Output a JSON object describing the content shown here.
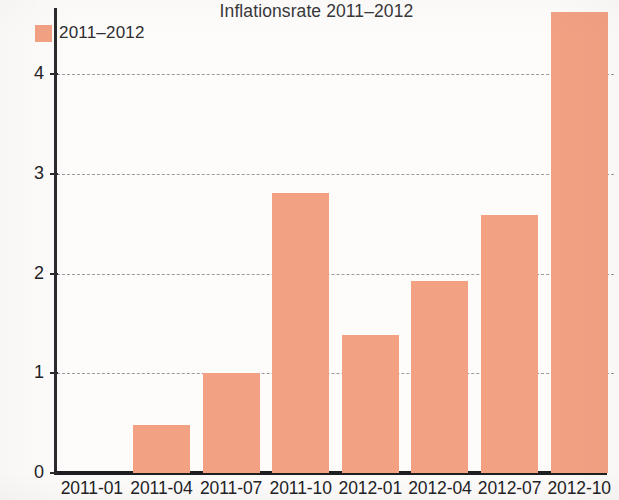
{
  "chart_data": {
    "type": "bar",
    "title": "Inflationsrate 2011–2012",
    "xlabel": "",
    "ylabel": "",
    "categories": [
      "2011-01",
      "2011-04",
      "2011-07",
      "2011-10",
      "2012-01",
      "2012-04",
      "2012-07",
      "2012-10"
    ],
    "values": [
      0,
      0.48,
      1.0,
      2.81,
      1.38,
      1.93,
      2.59,
      4.62
    ],
    "series": [
      {
        "name": "2011–2012",
        "values": [
          0,
          0.48,
          1.0,
          2.81,
          1.38,
          1.93,
          2.59,
          4.62
        ]
      }
    ],
    "legend": [
      "2011–2012"
    ],
    "legend_position": "top-left",
    "bar_color": "#f3a183",
    "ylim": [
      0,
      4.75
    ],
    "yticks": [
      0,
      1,
      2,
      3,
      4
    ],
    "ytick_labels": [
      "0",
      "1",
      "2",
      "3",
      "4"
    ],
    "grid": "horizontal-dashed",
    "grid_color": "#9a9aa0",
    "axis_color": "#1f1e20"
  },
  "legend": {
    "entries": [
      {
        "label": "2011–2012",
        "color": "#f3a183"
      }
    ]
  }
}
